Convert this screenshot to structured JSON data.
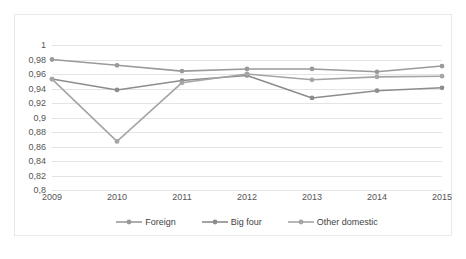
{
  "chart_data": {
    "type": "line",
    "title": "",
    "subtitle": "",
    "xlabel": "",
    "ylabel": "",
    "categories": [
      "2009",
      "2010",
      "2011",
      "2012",
      "2013",
      "2014",
      "2015"
    ],
    "ylim": [
      0.8,
      1.0
    ],
    "ytick_labels": [
      "1",
      "0,98",
      "0,96",
      "0,94",
      "0,92",
      "0,9",
      "0,88",
      "0,86",
      "0,84",
      "0,82",
      "0,8"
    ],
    "ytick_values": [
      1.0,
      0.98,
      0.96,
      0.94,
      0.92,
      0.9,
      0.88,
      0.86,
      0.84,
      0.82,
      0.8
    ],
    "grid": true,
    "legend_position": "bottom",
    "series": [
      {
        "name": "Foreign",
        "color": "#9a9a9a",
        "values": [
          0.98,
          0.972,
          0.964,
          0.967,
          0.967,
          0.963,
          0.971
        ]
      },
      {
        "name": "Big four",
        "color": "#8d8d8d",
        "values": [
          0.953,
          0.938,
          0.951,
          0.958,
          0.927,
          0.937,
          0.941
        ]
      },
      {
        "name": "Other domestic",
        "color": "#a5a5a5",
        "values": [
          0.953,
          0.867,
          0.948,
          0.96,
          0.952,
          0.956,
          0.957
        ]
      }
    ]
  },
  "legend": {
    "items": [
      {
        "label": "Foreign"
      },
      {
        "label": "Big four"
      },
      {
        "label": "Other domestic"
      }
    ]
  }
}
